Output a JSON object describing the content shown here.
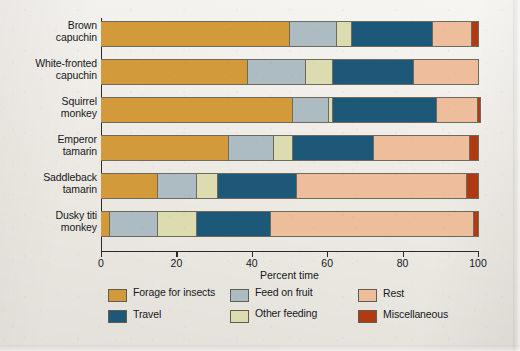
{
  "colors": {
    "forage_for_insects": "#d39a3b",
    "feed_on_fruit": "#adbcc2",
    "other_feeding": "#dcdcb0",
    "travel": "#1e5878",
    "rest": "#eebe9c",
    "miscellaneous": "#b03b12",
    "axis": "#2b2b2b",
    "background": "#f1eee8"
  },
  "legend": {
    "items": [
      {
        "label": "Forage for insects",
        "key": "forage_for_insects",
        "color": "#d39a3b"
      },
      {
        "label": "Feed on fruit",
        "key": "feed_on_fruit",
        "color": "#adbcc2"
      },
      {
        "label": "Rest",
        "key": "rest",
        "color": "#eebe9c"
      },
      {
        "label": "Travel",
        "key": "travel",
        "color": "#1e5878"
      },
      {
        "label": "Other feeding",
        "key": "other_feeding",
        "color": "#dcdcb0"
      },
      {
        "label": "Miscellaneous",
        "key": "miscellaneous",
        "color": "#b03b12"
      }
    ]
  },
  "chart_data": {
    "type": "bar",
    "orientation": "horizontal",
    "stacked": true,
    "stack_total": 100,
    "title": "",
    "xlabel": "Percent time",
    "ylabel": "",
    "xlim": [
      0,
      100
    ],
    "xticks": [
      0,
      20,
      40,
      60,
      80,
      100
    ],
    "xtick_labels": [
      "0",
      "20",
      "40",
      "60",
      "80",
      "100"
    ],
    "grid": false,
    "legend_position": "bottom",
    "categories": [
      "Brown capuchin",
      "White-fronted capuchin",
      "Squirrel monkey",
      "Emperor tamarin",
      "Saddleback tamarin",
      "Dusky titi monkey"
    ],
    "category_labels": [
      [
        "Brown",
        "capuchin"
      ],
      [
        "White-fronted",
        "capuchin"
      ],
      [
        "Squirrel",
        "monkey"
      ],
      [
        "Emperor",
        "tamarin"
      ],
      [
        "Saddleback",
        "tamarin"
      ],
      [
        "Dusky titi",
        "monkey"
      ]
    ],
    "series": [
      {
        "name": "Forage for insects",
        "key": "forage_for_insects",
        "values": [
          50,
          39,
          51,
          34,
          15,
          2.5
        ]
      },
      {
        "name": "Feed on fruit",
        "key": "feed_on_fruit",
        "values": [
          12.5,
          15.5,
          9.5,
          12,
          10.5,
          12.5
        ]
      },
      {
        "name": "Other feeding",
        "key": "other_feeding",
        "values": [
          4,
          7,
          1,
          5,
          5.5,
          10.5
        ]
      },
      {
        "name": "Travel",
        "key": "travel",
        "values": [
          21.5,
          21.5,
          27.5,
          21.5,
          21,
          19.5
        ]
      },
      {
        "name": "Rest",
        "key": "rest",
        "values": [
          10.5,
          17,
          11,
          25.5,
          45,
          54
        ]
      },
      {
        "name": "Miscellaneous",
        "key": "miscellaneous",
        "values": [
          1.5,
          0,
          0.5,
          2,
          3,
          1
        ]
      }
    ]
  }
}
